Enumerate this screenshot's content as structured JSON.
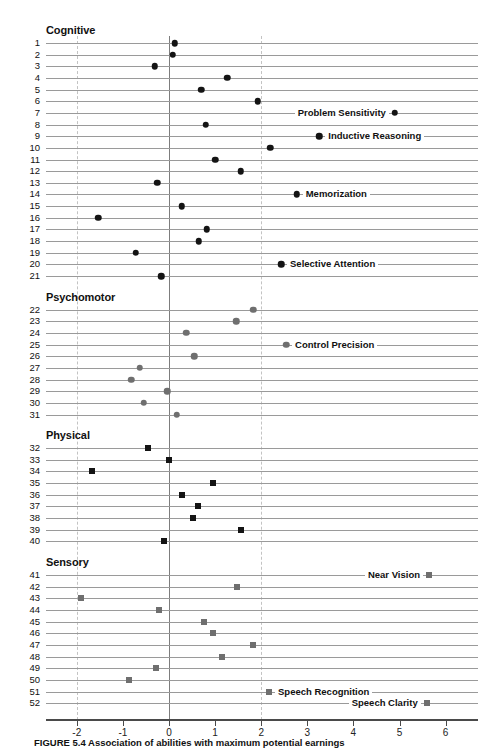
{
  "figure": {
    "caption_label": "FIGURE 5.4",
    "caption_text": "Association of abilities with maximum potential earnings"
  },
  "axis": {
    "ticks": [
      "-2",
      "-1",
      "0",
      "1",
      "2",
      "3",
      "4",
      "5",
      "6"
    ],
    "tick_values": [
      -2,
      -1,
      0,
      1,
      2,
      3,
      4,
      5,
      6
    ],
    "xmin": -2.6,
    "xmax": 6.4,
    "zero_line": 0,
    "dashed_lines": [
      -2,
      2
    ]
  },
  "sections": [
    {
      "id": "cognitive",
      "title": "Cognitive"
    },
    {
      "id": "psychomotor",
      "title": "Psychomotor"
    },
    {
      "id": "physical",
      "title": "Physical"
    },
    {
      "id": "sensory",
      "title": "Sensory"
    }
  ],
  "colors": {
    "cognitive_marker": "#141414",
    "psychomotor_marker": "#6f6f6f",
    "physical_marker": "#141414",
    "sensory_marker": "#6f6f6f",
    "rule": "#9a9a9a",
    "zero_line": "#7d7d7d",
    "dashed_line": "#c3c3c3",
    "axis": "#4a4a4a"
  },
  "chart_data": {
    "type": "scatter",
    "title": "Association of abilities with maximum potential earnings",
    "xlabel": "",
    "ylabel": "",
    "xlim": [
      -2.6,
      6.4
    ],
    "grid": true,
    "legend": "none",
    "orientation": "horizontal-dotplot",
    "xticks": [
      -2,
      -1,
      0,
      1,
      2,
      3,
      4,
      5,
      6
    ],
    "reference_lines": {
      "solid": [
        0
      ],
      "dashed": [
        -2,
        2
      ]
    },
    "groups": [
      {
        "name": "Cognitive",
        "marker": "circle",
        "color": "#141414",
        "points": [
          {
            "row": 1,
            "value": 0.13,
            "label": ""
          },
          {
            "row": 2,
            "value": 0.08,
            "label": ""
          },
          {
            "row": 3,
            "value": -0.31,
            "label": ""
          },
          {
            "row": 4,
            "value": 1.26,
            "label": ""
          },
          {
            "row": 5,
            "value": 0.7,
            "label": ""
          },
          {
            "row": 6,
            "value": 1.92,
            "label": ""
          },
          {
            "row": 7,
            "value": 4.9,
            "label": "Problem Sensitivity",
            "label_side": "left"
          },
          {
            "row": 8,
            "value": 0.8,
            "label": ""
          },
          {
            "row": 9,
            "value": 3.26,
            "label": "Inductive Reasoning",
            "label_side": "right"
          },
          {
            "row": 10,
            "value": 2.2,
            "label": ""
          },
          {
            "row": 11,
            "value": 1.0,
            "label": ""
          },
          {
            "row": 12,
            "value": 1.56,
            "label": ""
          },
          {
            "row": 13,
            "value": -0.26,
            "label": ""
          },
          {
            "row": 14,
            "value": 2.77,
            "label": "Memorization",
            "label_side": "right"
          },
          {
            "row": 15,
            "value": 0.28,
            "label": ""
          },
          {
            "row": 16,
            "value": -1.54,
            "label": ""
          },
          {
            "row": 17,
            "value": 0.82,
            "label": ""
          },
          {
            "row": 18,
            "value": 0.65,
            "label": ""
          },
          {
            "row": 19,
            "value": -0.72,
            "label": ""
          },
          {
            "row": 20,
            "value": 2.43,
            "label": "Selective Attention",
            "label_side": "right"
          },
          {
            "row": 21,
            "value": -0.17,
            "label": ""
          }
        ]
      },
      {
        "name": "Psychomotor",
        "marker": "circle",
        "color": "#6f6f6f",
        "points": [
          {
            "row": 22,
            "value": 1.83,
            "label": ""
          },
          {
            "row": 23,
            "value": 1.46,
            "label": ""
          },
          {
            "row": 24,
            "value": 0.37,
            "label": ""
          },
          {
            "row": 25,
            "value": 2.54,
            "label": "Control Precision",
            "label_side": "right"
          },
          {
            "row": 26,
            "value": 0.55,
            "label": ""
          },
          {
            "row": 27,
            "value": -0.63,
            "label": ""
          },
          {
            "row": 28,
            "value": -0.82,
            "label": ""
          },
          {
            "row": 29,
            "value": -0.04,
            "label": ""
          },
          {
            "row": 30,
            "value": -0.55,
            "label": ""
          },
          {
            "row": 31,
            "value": 0.17,
            "label": ""
          }
        ]
      },
      {
        "name": "Physical",
        "marker": "square",
        "color": "#141414",
        "points": [
          {
            "row": 32,
            "value": -0.45,
            "label": ""
          },
          {
            "row": 33,
            "value": 0.0,
            "label": ""
          },
          {
            "row": 34,
            "value": -1.67,
            "label": ""
          },
          {
            "row": 35,
            "value": 0.96,
            "label": ""
          },
          {
            "row": 36,
            "value": 0.28,
            "label": ""
          },
          {
            "row": 37,
            "value": 0.63,
            "label": ""
          },
          {
            "row": 38,
            "value": 0.52,
            "label": ""
          },
          {
            "row": 39,
            "value": 1.56,
            "label": ""
          },
          {
            "row": 40,
            "value": -0.11,
            "label": ""
          }
        ]
      },
      {
        "name": "Sensory",
        "marker": "square",
        "color": "#6f6f6f",
        "points": [
          {
            "row": 41,
            "value": 5.64,
            "label": "Near Vision",
            "label_side": "left"
          },
          {
            "row": 42,
            "value": 1.48,
            "label": ""
          },
          {
            "row": 43,
            "value": -1.91,
            "label": ""
          },
          {
            "row": 44,
            "value": -0.22,
            "label": ""
          },
          {
            "row": 45,
            "value": 0.76,
            "label": ""
          },
          {
            "row": 46,
            "value": 0.96,
            "label": ""
          },
          {
            "row": 47,
            "value": 1.82,
            "label": ""
          },
          {
            "row": 48,
            "value": 1.15,
            "label": ""
          },
          {
            "row": 49,
            "value": -0.28,
            "label": ""
          },
          {
            "row": 50,
            "value": -0.87,
            "label": ""
          },
          {
            "row": 51,
            "value": 2.17,
            "label": "Speech Recognition",
            "label_side": "right"
          },
          {
            "row": 52,
            "value": 5.59,
            "label": "Speech Clarity",
            "label_side": "left"
          }
        ]
      }
    ]
  }
}
